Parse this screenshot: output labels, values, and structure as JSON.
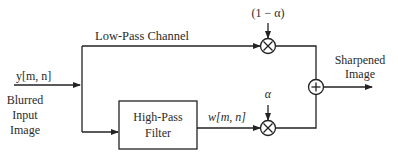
{
  "diagram": {
    "input": {
      "signal_label": "y[m, n]",
      "name_lines": [
        "Blurred",
        "Input",
        "Image"
      ]
    },
    "low_pass": {
      "label": "Low-Pass Channel",
      "weight_label": "(1 − α)"
    },
    "high_pass": {
      "block_lines": [
        "High-Pass",
        "Filter"
      ],
      "output_label": "w[m, n]",
      "weight_label": "α"
    },
    "multiplier_symbol": "×",
    "adder_symbol": "+",
    "output": {
      "name_lines": [
        "Sharpened",
        "Image"
      ]
    }
  }
}
